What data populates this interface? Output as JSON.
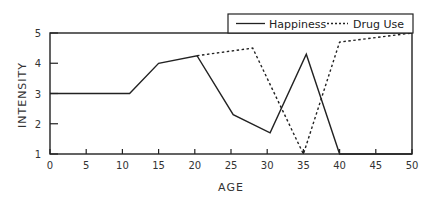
{
  "chart_data": {
    "type": "line",
    "title": "",
    "xlabel": "AGE",
    "ylabel": "INTENSITY",
    "xlim": [
      0,
      50
    ],
    "ylim": [
      1,
      5
    ],
    "xticks": [
      0,
      5,
      10,
      15,
      20,
      25,
      30,
      35,
      40,
      45,
      50
    ],
    "yticks": [
      1,
      2,
      3,
      4,
      5
    ],
    "grid": false,
    "legend_position": "top-right, above plot",
    "series": [
      {
        "name": "Happiness",
        "style": "solid",
        "x": [
          0,
          11,
          15,
          20.3,
          25.3,
          30.4,
          35.4,
          40,
          50
        ],
        "y": [
          3,
          3,
          4,
          4.25,
          2.3,
          1.7,
          4.3,
          1,
          1
        ]
      },
      {
        "name": "Drug Use",
        "style": "dashed",
        "x": [
          20.3,
          28,
          35,
          40,
          50
        ],
        "y": [
          4.25,
          4.5,
          1,
          4.7,
          5
        ]
      }
    ]
  },
  "legend": {
    "items": [
      "Happiness",
      "Drug Use"
    ]
  },
  "axes": {
    "x_label": "AGE",
    "y_label": "INTENSITY",
    "x_tick_labels": [
      "0",
      "5",
      "10",
      "15",
      "20",
      "25",
      "30",
      "35",
      "40",
      "45",
      "50"
    ],
    "y_tick_labels": [
      "1",
      "2",
      "3",
      "4",
      "5"
    ]
  }
}
